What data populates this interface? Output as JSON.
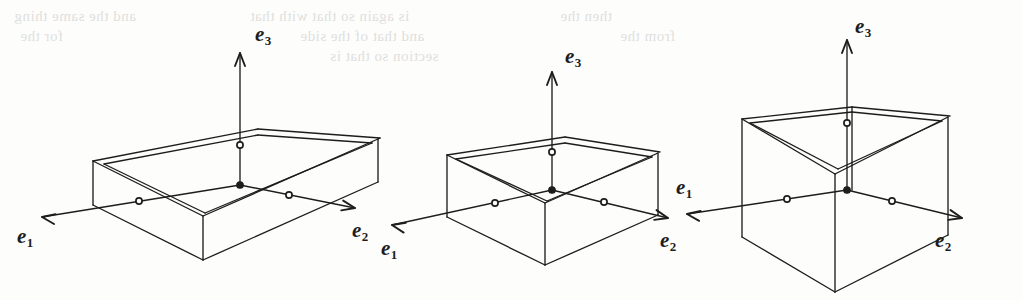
{
  "figure": {
    "background_color": "#fdfdfc",
    "ink_color": "#1d1d1d",
    "width": 1022,
    "height": 300
  },
  "bleed_text": {
    "description": "faint show-through text from the reverse side of the scanned page",
    "color": "#9a9a96",
    "lines": [
      {
        "text": "and the same thing",
        "x": 14,
        "y": 8
      },
      {
        "text": "is again so that with that",
        "x": 250,
        "y": 8
      },
      {
        "text": "then the",
        "x": 560,
        "y": 8
      },
      {
        "text": "for the",
        "x": 20,
        "y": 28
      },
      {
        "text": "and that of the side",
        "x": 300,
        "y": 28
      },
      {
        "text": "from the",
        "x": 620,
        "y": 28
      },
      {
        "text": "section so that is",
        "x": 330,
        "y": 48
      }
    ]
  },
  "boxes": [
    {
      "id": "box-flat",
      "name": "flat-wide-box",
      "shape_label": "flat",
      "origin": {
        "x": 240,
        "y": 185
      },
      "axis_labels": {
        "e1": "e",
        "e1_sub": "1",
        "e2": "e",
        "e2_sub": "2",
        "e3": "e",
        "e3_sub": "3"
      },
      "label_positions": {
        "e1": {
          "x": 17,
          "y": 224
        },
        "e2": {
          "x": 352,
          "y": 218
        },
        "e3": {
          "x": 255,
          "y": 22
        }
      },
      "markers": {
        "origin": "filled-dot",
        "unit": "open-circle"
      }
    },
    {
      "id": "box-medium",
      "name": "medium-square-box",
      "shape_label": "medium",
      "origin": {
        "x": 552,
        "y": 190
      },
      "axis_labels": {
        "e1": "e",
        "e1_sub": "1",
        "e2": "e",
        "e2_sub": "2",
        "e3": "e",
        "e3_sub": "3"
      },
      "label_positions": {
        "e1": {
          "x": 381,
          "y": 236
        },
        "e2": {
          "x": 660,
          "y": 228
        },
        "e3": {
          "x": 565,
          "y": 44
        }
      },
      "markers": {
        "origin": "filled-dot",
        "unit": "open-circle"
      }
    },
    {
      "id": "box-cube",
      "name": "tall-cube-box",
      "shape_label": "cube",
      "origin": {
        "x": 847,
        "y": 190
      },
      "axis_labels": {
        "e1": "e",
        "e1_sub": "1",
        "e2": "e",
        "e2_sub": "2",
        "e3": "e",
        "e3_sub": "3"
      },
      "label_positions": {
        "e1": {
          "x": 676,
          "y": 175
        },
        "e2": {
          "x": 935,
          "y": 228
        },
        "e3": {
          "x": 855,
          "y": 14
        }
      },
      "markers": {
        "origin": "filled-dot",
        "unit": "open-circle"
      }
    }
  ],
  "geometry": {
    "box_flat": {
      "front_bottom_left": {
        "x": 93,
        "y": 205
      },
      "front_bottom_mid": {
        "x": 203,
        "y": 260
      },
      "front_bottom_right": {
        "x": 378,
        "y": 182
      },
      "front_top_left": {
        "x": 93,
        "y": 161
      },
      "front_top_mid": {
        "x": 203,
        "y": 216
      },
      "front_top_right": {
        "x": 378,
        "y": 139
      },
      "back_top_left": {
        "x": 258,
        "y": 129
      },
      "back_top_right": {
        "x": 380,
        "y": 138
      },
      "inner_top_mid": {
        "x": 258,
        "y": 171
      }
    },
    "box_medium": {
      "front_bottom_left": {
        "x": 447,
        "y": 217
      },
      "front_bottom_mid": {
        "x": 545,
        "y": 265
      },
      "front_bottom_right": {
        "x": 658,
        "y": 215
      },
      "front_top_left": {
        "x": 447,
        "y": 155
      },
      "front_top_mid": {
        "x": 545,
        "y": 203
      },
      "front_top_right": {
        "x": 658,
        "y": 153
      },
      "back_top_left": {
        "x": 565,
        "y": 137
      }
    },
    "box_cube": {
      "front_bottom_left": {
        "x": 742,
        "y": 237
      },
      "front_bottom_mid": {
        "x": 835,
        "y": 292
      },
      "front_bottom_right": {
        "x": 948,
        "y": 235
      },
      "front_top_left": {
        "x": 742,
        "y": 119
      },
      "front_top_mid": {
        "x": 835,
        "y": 174
      },
      "front_top_right": {
        "x": 948,
        "y": 117
      },
      "back_top_left": {
        "x": 852,
        "y": 107
      }
    }
  }
}
